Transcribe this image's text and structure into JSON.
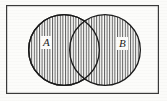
{
  "figure": {
    "kind": "venn-diagram",
    "background_color": "#fbfbf9",
    "ink_color": "#1a1a1a"
  },
  "universe_box": {
    "name": "universal-set-rectangle",
    "x": 6,
    "y": 5,
    "width": 153,
    "height": 89,
    "stroke_color": "#3a3a3a",
    "stroke_width": 1.2,
    "fill_color": "#fcfcfa"
  },
  "circles": [
    {
      "id": "circle-a",
      "label": "A",
      "cx": 64,
      "cy": 50,
      "r": 36,
      "stroke_color": "#1a1a1a",
      "stroke_width": 1.3,
      "fill": "vertical-hatch"
    },
    {
      "id": "circle-b",
      "label": "B",
      "cx": 105,
      "cy": 50,
      "r": 36,
      "stroke_color": "#1a1a1a",
      "stroke_width": 1.3,
      "fill": "vertical-hatch"
    }
  ],
  "hatch": {
    "name": "vertical-hatch-pattern",
    "orientation": "vertical",
    "spacing_px": 2.6,
    "line_width": 1.0,
    "line_color": "#5c5c5c"
  },
  "labels": {
    "a": "A",
    "b": "B"
  }
}
